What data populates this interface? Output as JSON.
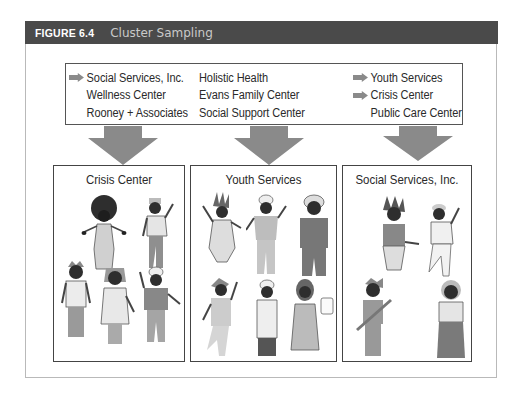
{
  "figure": {
    "number": "FIGURE 6.4",
    "title": "Cluster Sampling"
  },
  "population": {
    "columns": [
      {
        "items": [
          {
            "label": "Social Services, Inc.",
            "selected": true
          },
          {
            "label": "Wellness Center",
            "selected": false
          },
          {
            "label": "Rooney + Associates",
            "selected": false
          }
        ]
      },
      {
        "items": [
          {
            "label": "Holistic Health",
            "selected": false
          },
          {
            "label": "Evans Family Center",
            "selected": false
          },
          {
            "label": "Social Support Center",
            "selected": false
          }
        ]
      },
      {
        "items": [
          {
            "label": "Youth Services",
            "selected": true
          },
          {
            "label": "Crisis Center",
            "selected": true
          },
          {
            "label": "Public Care Center",
            "selected": false
          }
        ]
      }
    ]
  },
  "clusters": [
    {
      "title": "Crisis Center",
      "member_count": 5
    },
    {
      "title": "Youth Services",
      "member_count": 6
    },
    {
      "title": "Social Services, Inc.",
      "member_count": 4
    }
  ],
  "icons": {
    "selection_marker": "right-arrow-icon",
    "flow_marker": "down-arrow-icon",
    "member": "person-illustration"
  },
  "colors": {
    "header_bg": "#4a4a4a",
    "header_number": "#ffffff",
    "header_title": "#c9c9c9",
    "arrow": "#8a8a8a",
    "border": "#444444",
    "frame": "#b9b9b9"
  }
}
